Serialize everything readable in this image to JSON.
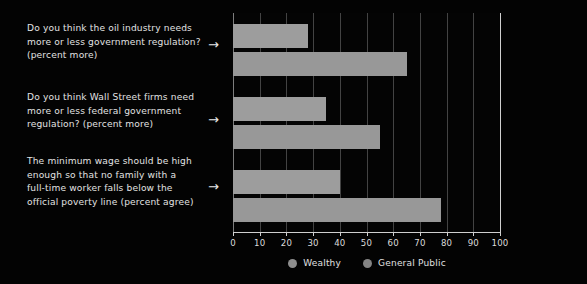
{
  "chart_data": {
    "type": "bar",
    "orientation": "horizontal",
    "title": "",
    "xlabel": "",
    "ylabel": "",
    "xlim": [
      0,
      100
    ],
    "xticks": [
      0,
      10,
      20,
      30,
      40,
      50,
      60,
      70,
      80,
      90,
      100
    ],
    "grid": true,
    "legend_position": "bottom",
    "categories": [
      "Do you think the oil industry needs\nmore or less government regulation?\n(percent more)",
      "Do you think Wall Street firms need\nmore or less federal government\nregulation? (percent more)",
      "The minimum wage should be high\nenough so that no family with a\nfull-time worker falls below the\nofficial poverty line (percent  agree)"
    ],
    "series": [
      {
        "name": "Wealthy",
        "color": "#9d9d9d",
        "values": [
          28,
          35,
          40
        ]
      },
      {
        "name": "General Public",
        "color": "#989898",
        "values": [
          65,
          55,
          78
        ]
      }
    ],
    "annotations": [
      "→",
      "→",
      "→"
    ]
  },
  "legend": {
    "items": [
      {
        "label": "Wealthy"
      },
      {
        "label": "General Public"
      }
    ]
  },
  "colors": {
    "background": "#030303",
    "panel": "#1e1e1e",
    "bar": "#9a9a9a",
    "text": "#e2e2e2",
    "axis": "#cfcfcf"
  }
}
